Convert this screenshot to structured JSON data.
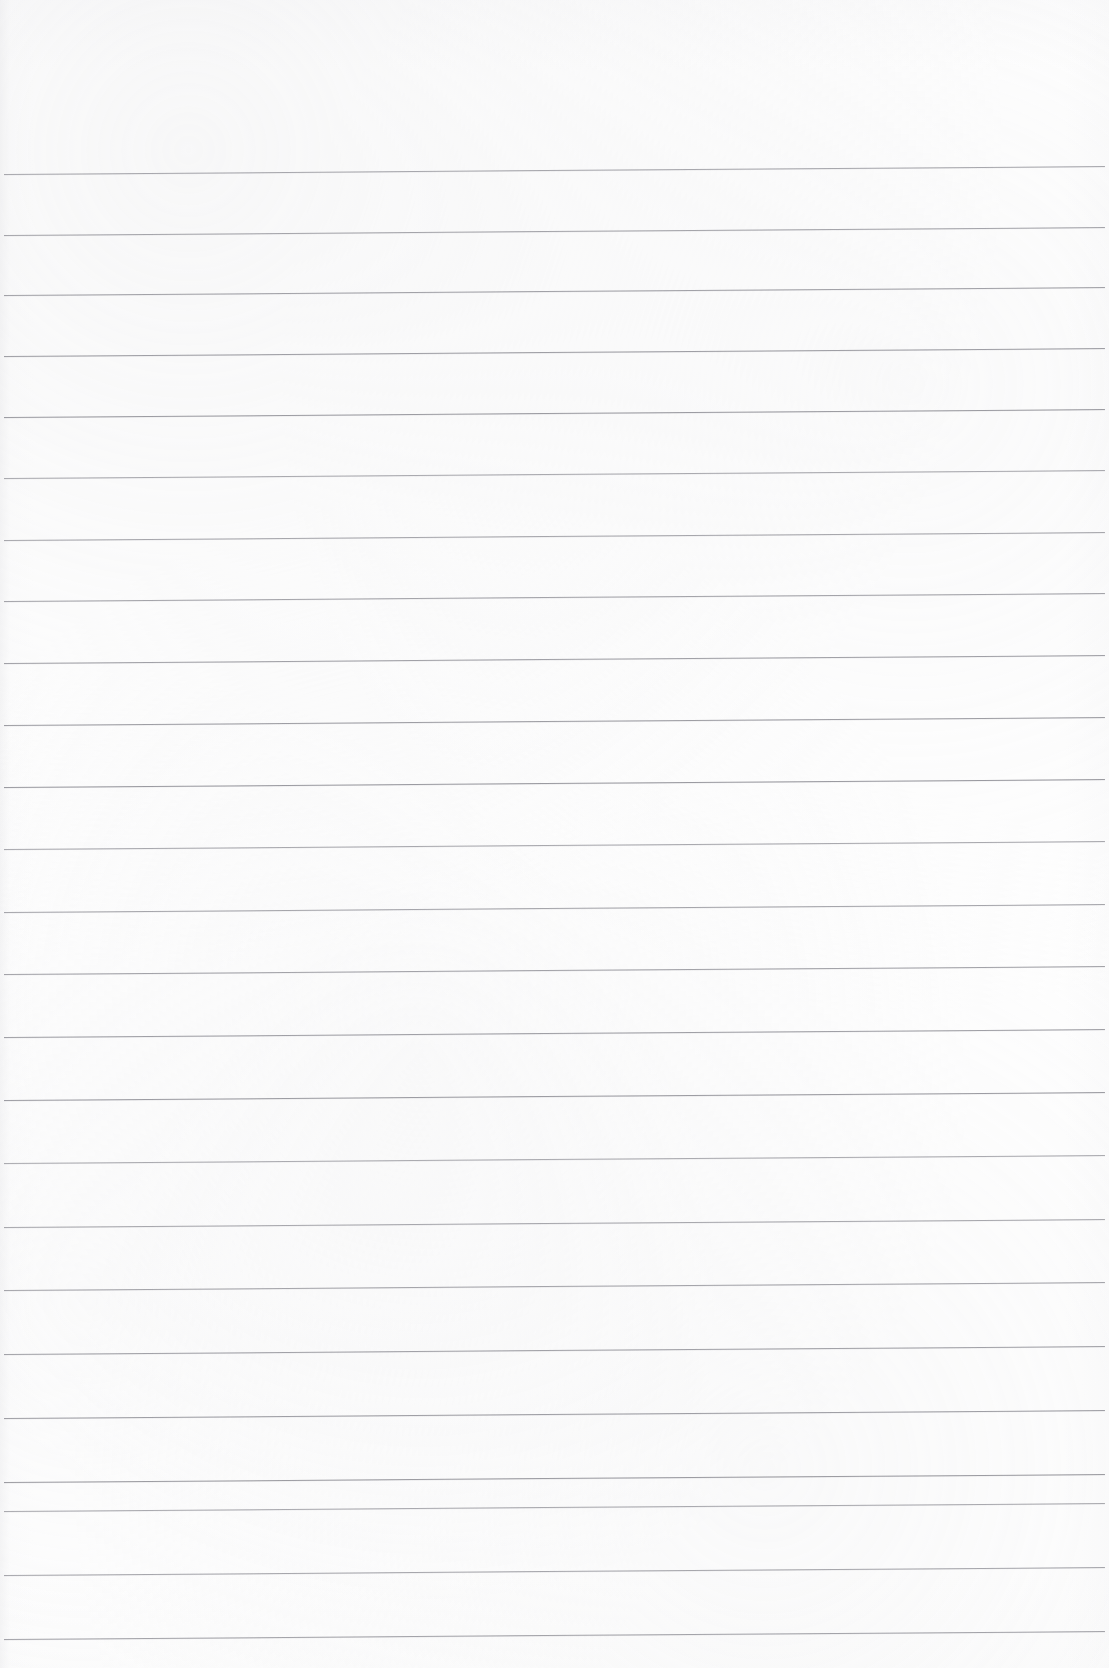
{
  "document": {
    "kind": "lined-notebook-paper",
    "title": "Blank ruled notebook page",
    "orientation": "portrait",
    "page_width": 1109,
    "page_height": 1668,
    "written_content": "",
    "has_text": false,
    "has_margin_rule": false,
    "has_holes": false
  },
  "paper": {
    "background_color": "#fefefe",
    "edge_tint_color": "#ececee"
  },
  "ruling": {
    "line_color": "#9a9aa0",
    "line_thickness_px": 1,
    "line_count": 25,
    "first_line_y": 170,
    "spacing_start_px": 60.5,
    "spacing_end_px": 63.5,
    "line_start_x": 4,
    "line_end_x": 1105,
    "tilt_degrees": -0.42,
    "tilt_rise_px": 8,
    "lines": [
      {
        "index": 1,
        "y_left": 174,
        "y_right": 166
      },
      {
        "index": 2,
        "y_left": 235,
        "y_right": 227
      },
      {
        "index": 3,
        "y_left": 295,
        "y_right": 287
      },
      {
        "index": 4,
        "y_left": 356,
        "y_right": 348
      },
      {
        "index": 5,
        "y_left": 417,
        "y_right": 409
      },
      {
        "index": 6,
        "y_left": 478,
        "y_right": 470
      },
      {
        "index": 7,
        "y_left": 540,
        "y_right": 532
      },
      {
        "index": 8,
        "y_left": 601,
        "y_right": 593
      },
      {
        "index": 9,
        "y_left": 663,
        "y_right": 655
      },
      {
        "index": 10,
        "y_left": 725,
        "y_right": 717
      },
      {
        "index": 11,
        "y_left": 787,
        "y_right": 779
      },
      {
        "index": 12,
        "y_left": 849,
        "y_right": 841
      },
      {
        "index": 13,
        "y_left": 912,
        "y_right": 904
      },
      {
        "index": 14,
        "y_left": 974,
        "y_right": 966
      },
      {
        "index": 15,
        "y_left": 1037,
        "y_right": 1029
      },
      {
        "index": 16,
        "y_left": 1100,
        "y_right": 1092
      },
      {
        "index": 17,
        "y_left": 1163,
        "y_right": 1155
      },
      {
        "index": 18,
        "y_left": 1227,
        "y_right": 1219
      },
      {
        "index": 19,
        "y_left": 1290,
        "y_right": 1282
      },
      {
        "index": 20,
        "y_left": 1354,
        "y_right": 1346
      },
      {
        "index": 21,
        "y_left": 1418,
        "y_right": 1410
      },
      {
        "index": 22,
        "y_left": 1482,
        "y_right": 1474
      },
      {
        "index": 23,
        "y_left": 1511,
        "y_right": 1503
      },
      {
        "index": 24,
        "y_left": 1575,
        "y_right": 1567
      },
      {
        "index": 25,
        "y_left": 1639,
        "y_right": 1631
      }
    ]
  }
}
